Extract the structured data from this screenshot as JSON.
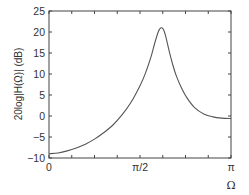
{
  "chart_data": {
    "type": "line",
    "title": "",
    "xlabel": "Ω",
    "ylabel": "20log|H(Ω)| (dB)",
    "xlim": [
      0,
      3.14159
    ],
    "ylim": [
      -10,
      25
    ],
    "grid": false,
    "legend": null,
    "x_ticks": [
      {
        "value": 0,
        "label": "0"
      },
      {
        "value": 1.5708,
        "label": "π/2"
      },
      {
        "value": 3.14159,
        "label": "π"
      }
    ],
    "x_minor_ticks_count_per_half": 3,
    "y_ticks": [
      {
        "value": -10,
        "label": "−10"
      },
      {
        "value": -5,
        "label": "−5"
      },
      {
        "value": 0,
        "label": "0"
      },
      {
        "value": 5,
        "label": "5"
      },
      {
        "value": 10,
        "label": "10"
      },
      {
        "value": 15,
        "label": "15"
      },
      {
        "value": 20,
        "label": "20"
      },
      {
        "value": 25,
        "label": "25"
      }
    ],
    "series": [
      {
        "name": "magnitude response",
        "color": "#555555",
        "x_over_pi": [
          0,
          0.05,
          0.1,
          0.15,
          0.2,
          0.25,
          0.3,
          0.35,
          0.4,
          0.45,
          0.5,
          0.53,
          0.56,
          0.58,
          0.6,
          0.61,
          0.62,
          0.63,
          0.64,
          0.66,
          0.68,
          0.7,
          0.73,
          0.76,
          0.8,
          0.85,
          0.9,
          0.95,
          1.0
        ],
        "y_db": [
          -9.0,
          -8.8,
          -8.3,
          -7.6,
          -6.7,
          -5.5,
          -4.0,
          -2.2,
          0.2,
          3.2,
          7.2,
          10.2,
          14.0,
          17.2,
          20.0,
          20.8,
          21.0,
          20.5,
          19.2,
          15.5,
          12.2,
          9.5,
          6.5,
          4.2,
          2.0,
          0.5,
          -0.2,
          -0.5,
          -0.6
        ]
      }
    ]
  }
}
